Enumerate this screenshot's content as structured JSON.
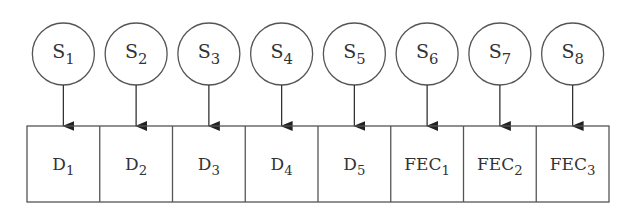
{
  "diagram": {
    "type": "symbol-to-packet mapping",
    "colors": {
      "stroke": "#555555",
      "text": "#333333",
      "background": "#ffffff"
    },
    "symbols": [
      {
        "base": "S",
        "sub": "1"
      },
      {
        "base": "S",
        "sub": "2"
      },
      {
        "base": "S",
        "sub": "3"
      },
      {
        "base": "S",
        "sub": "4"
      },
      {
        "base": "S",
        "sub": "5"
      },
      {
        "base": "S",
        "sub": "6"
      },
      {
        "base": "S",
        "sub": "7"
      },
      {
        "base": "S",
        "sub": "8"
      }
    ],
    "packets": [
      {
        "base": "D",
        "sub": "1"
      },
      {
        "base": "D",
        "sub": "2"
      },
      {
        "base": "D",
        "sub": "3"
      },
      {
        "base": "D",
        "sub": "4"
      },
      {
        "base": "D",
        "sub": "5"
      },
      {
        "base": "FEC",
        "sub": "1"
      },
      {
        "base": "FEC",
        "sub": "2"
      },
      {
        "base": "FEC",
        "sub": "3"
      }
    ],
    "edges": [
      [
        "S1",
        "D1"
      ],
      [
        "S2",
        "D2"
      ],
      [
        "S3",
        "D3"
      ],
      [
        "S4",
        "D4"
      ],
      [
        "S5",
        "D5"
      ],
      [
        "S6",
        "FEC1"
      ],
      [
        "S7",
        "FEC2"
      ],
      [
        "S8",
        "FEC3"
      ]
    ]
  }
}
